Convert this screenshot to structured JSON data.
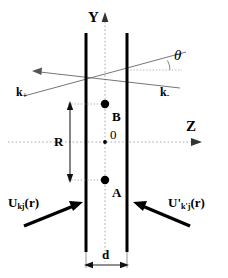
{
  "figure": {
    "colors": {
      "slab_line": "#000000",
      "axis_dotted": "#999999",
      "ray_thin": "#555555",
      "arrow_thick": "#000000",
      "point_dot": "#000000",
      "background": "#ffffff"
    },
    "axes": {
      "vertical_label": "Y",
      "horizontal_label": "Z",
      "origin_label": "0"
    },
    "points": [
      {
        "id": "B",
        "label": "B",
        "position": "upper"
      },
      {
        "id": "A",
        "label": "A",
        "position": "lower"
      }
    ],
    "measurements": [
      {
        "id": "R",
        "label": "R",
        "orientation": "vertical",
        "describes": "separation between points A and B"
      },
      {
        "id": "d",
        "label": "d",
        "orientation": "horizontal",
        "describes": "slab separation"
      }
    ],
    "wavevectors": [
      {
        "id": "k-plus",
        "base": "k",
        "subscript": "+"
      },
      {
        "id": "k-minus",
        "base": "k",
        "subscript": "-"
      }
    ],
    "angle": {
      "symbol": "θ",
      "name": "theta"
    },
    "fields": [
      {
        "id": "incident-left",
        "base": "U",
        "prime": "",
        "subscript": "kj",
        "argument": "(r)"
      },
      {
        "id": "incident-right",
        "base": "U",
        "prime": "'",
        "subscript": "k'j",
        "argument": "(r)"
      }
    ]
  }
}
